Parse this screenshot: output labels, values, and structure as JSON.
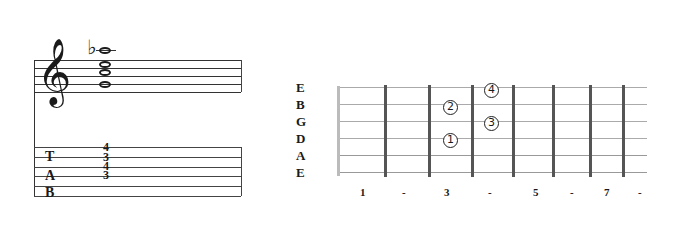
{
  "notation": {
    "clef": "treble-clef",
    "accidental": "♭",
    "chord_notes": [
      "Bb5 (ledger, flat)",
      "G5",
      "E5",
      "C5"
    ]
  },
  "tab": {
    "letters": [
      "T",
      "A",
      "B"
    ],
    "frets": [
      "4",
      "3",
      "4",
      "3"
    ]
  },
  "fretboard": {
    "string_labels": [
      "E",
      "B",
      "G",
      "D",
      "A",
      "E"
    ],
    "fingers": [
      {
        "label": "4",
        "string": "E",
        "fret": 4
      },
      {
        "label": "2",
        "string": "B",
        "fret": 3
      },
      {
        "label": "3",
        "string": "G",
        "fret": 4
      },
      {
        "label": "1",
        "string": "D",
        "fret": 3
      }
    ],
    "fret_markers": [
      "1",
      "-",
      "3",
      "-",
      "5",
      "-",
      "7",
      "-"
    ]
  }
}
